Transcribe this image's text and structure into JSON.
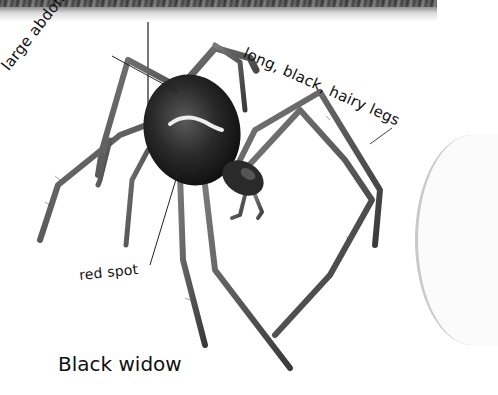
{
  "illustration": {
    "subject": "black widow spider",
    "labels": {
      "abdomen": "large abdomen",
      "legs": "long, black, hairy legs",
      "spot": "red spot"
    },
    "caption": "Black widow"
  }
}
